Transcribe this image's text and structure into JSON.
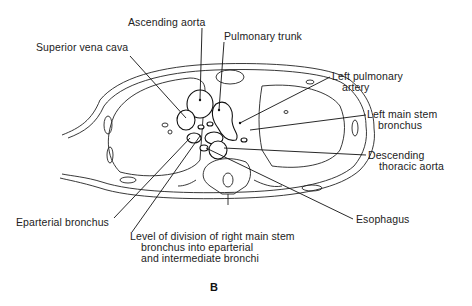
{
  "figure": {
    "panel_letter": "B"
  },
  "labels": {
    "ascending_aorta": "Ascending aorta",
    "pulmonary_trunk": "Pulmonary trunk",
    "superior_vena_cava": "Superior vena cava",
    "left_pulmonary_artery": [
      "Left pulmonary",
      "artery"
    ],
    "left_main_stem_bronchus": [
      "Left main stem",
      "bronchus"
    ],
    "descending_thoracic_aorta": [
      "Descending",
      "thoracic aorta"
    ],
    "esophagus": "Esophagus",
    "eparterial_bronchus": "Eparterial bronchus",
    "level_of_division": [
      "Level of division of right main stem",
      "bronchus into eparterial",
      "and intermediate bronchi"
    ]
  }
}
